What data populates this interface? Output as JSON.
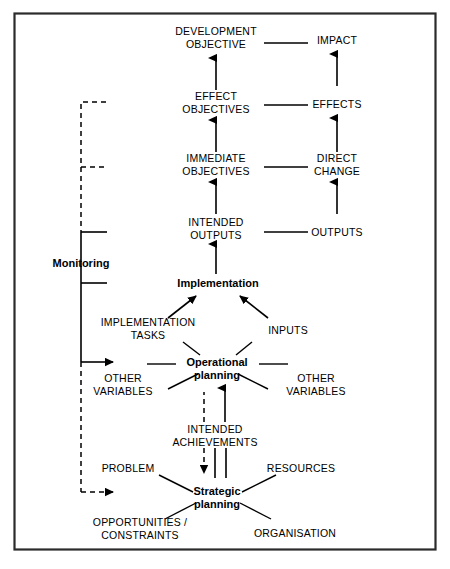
{
  "figure": {
    "background_color": "#ffffff",
    "ink_color": "#000000",
    "frame_color": "#2b2b2b"
  },
  "nodes": {
    "development_objective": "DEVELOPMENT\nOBJECTIVE",
    "development_objective_line1": "DEVELOPMENT",
    "development_objective_line2": "OBJECTIVE",
    "impact": "IMPACT",
    "effect_objectives_line1": "EFFECT",
    "effect_objectives_line2": "OBJECTIVES",
    "effects": "EFFECTS",
    "immediate_objectives_line1": "IMMEDIATE",
    "immediate_objectives_line2": "OBJECTIVES",
    "direct_change_line1": "DIRECT",
    "direct_change_line2": "CHANGE",
    "intended_outputs_line1": "INTENDED",
    "intended_outputs_line2": "OUTPUTS",
    "outputs": "OUTPUTS",
    "monitoring": "Monitoring",
    "implementation": "Implementation",
    "implementation_tasks_line1": "IMPLEMENTATION",
    "implementation_tasks_line2": "TASKS",
    "inputs": "INPUTS",
    "operational_planning_line1": "Operational",
    "operational_planning_line2": "planning",
    "other_variables_left_line1": "OTHER",
    "other_variables_left_line2": "VARIABLES",
    "other_variables_right_line1": "OTHER",
    "other_variables_right_line2": "VARIABLES",
    "intended_achievements_line1": "INTENDED",
    "intended_achievements_line2": "ACHIEVEMENTS",
    "problem": "PROBLEM",
    "resources": "RESOURCES",
    "strategic_planning_line1": "Strategic",
    "strategic_planning_line2": "planning",
    "opportunities_constraints_line1": "OPPORTUNITIES /",
    "opportunities_constraints_line2": "CONSTRAINTS",
    "organisation": "ORGANISATION"
  }
}
